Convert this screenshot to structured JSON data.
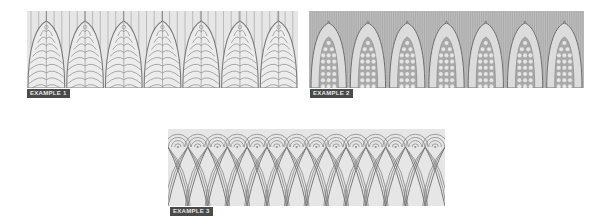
{
  "examples": [
    {
      "label": "EXAMPLE 1",
      "description": "Pointed arches filled with nested arcs over vertical lines",
      "arch_count": 7,
      "background": "#e6e6e6",
      "stroke": "#7a7a7a"
    },
    {
      "label": "EXAMPLE 2",
      "description": "Pointed arches with pale border filled with circles on hatched background",
      "arch_count": 7,
      "background": "#bdbdbd",
      "stroke": "#6e6e6e"
    },
    {
      "label": "EXAMPLE 3",
      "description": "Overlapping pointed arcs topped by concentric semicircle caps",
      "arch_count": 14,
      "background": "#e6e6e6",
      "stroke": "#7a7a7a"
    }
  ]
}
